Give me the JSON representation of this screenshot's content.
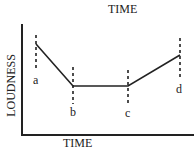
{
  "chart_data": {
    "type": "line",
    "title": "TIME",
    "xlabel": "TIME",
    "ylabel": "LOUDNESS",
    "grid": false,
    "legend": null,
    "points": [
      {
        "label": "a",
        "x": 36,
        "y": 44
      },
      {
        "label": "b",
        "x": 73,
        "y": 86
      },
      {
        "label": "c",
        "x": 128,
        "y": 86
      },
      {
        "label": "d",
        "x": 180,
        "y": 55
      }
    ],
    "markers": [
      {
        "label": "a",
        "x": 36,
        "dash_top": 35,
        "dash_bottom": 70,
        "label_x": 33,
        "label_y": 73
      },
      {
        "label": "b",
        "x": 73,
        "dash_top": 67,
        "dash_bottom": 104,
        "label_x": 70,
        "label_y": 105
      },
      {
        "label": "c",
        "x": 128,
        "dash_top": 70,
        "dash_bottom": 104,
        "label_x": 125,
        "label_y": 106
      },
      {
        "label": "d",
        "x": 180,
        "dash_top": 38,
        "dash_bottom": 78,
        "label_x": 176,
        "label_y": 82
      }
    ],
    "axes": {
      "origin_x": 22,
      "origin_y": 135,
      "y_top": 24,
      "x_right": 193
    }
  },
  "labels": {
    "top_title": "TIME",
    "x_axis": "TIME",
    "y_axis": "LOUDNESS",
    "a": "a",
    "b": "b",
    "c": "c",
    "d": "d"
  },
  "colors": {
    "line": "#222222",
    "axis": "#222222",
    "background": "#ffffff"
  }
}
